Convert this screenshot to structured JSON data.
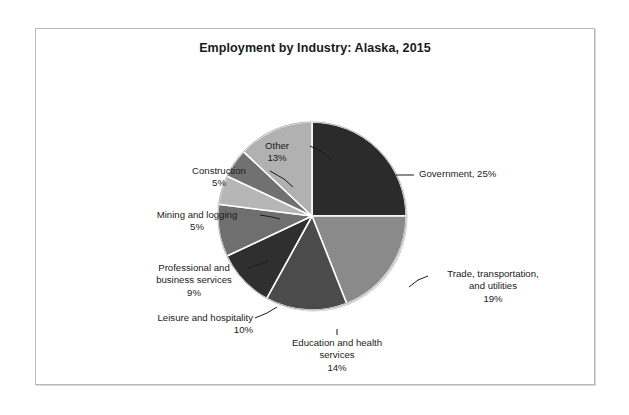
{
  "chart_data": {
    "type": "pie",
    "title": "Employment by Industry: Alaska, 2015",
    "xlabel": "",
    "ylabel": "",
    "legend_position": "none",
    "grid": false,
    "units": "percent of total employment",
    "categories": [
      "Government",
      "Trade, transportation, and utilities",
      "Education and health services",
      "Leisure and hospitality",
      "Professional and business services",
      "Mining and logging",
      "Construction",
      "Other"
    ],
    "values": [
      25,
      19,
      14,
      10,
      9,
      5,
      5,
      13
    ],
    "colors": [
      "#2b2b2b",
      "#8a8a8a",
      "#4b4b4b",
      "#2f2f2f",
      "#6f6f6f",
      "#b6b6b6",
      "#717171",
      "#b1b1b1"
    ],
    "start_angle_deg": 0,
    "direction": "clockwise",
    "slices": [
      {
        "name": "Government",
        "label": "Government, 25%",
        "value": 25,
        "value_text": "25%",
        "color": "#2b2b2b"
      },
      {
        "name": "Trade, transportation, and utilities",
        "label": "Trade, transportation,\nand utilities\n19%",
        "value": 19,
        "value_text": "19%",
        "color": "#8a8a8a"
      },
      {
        "name": "Education and health services",
        "label": "Education and health\nservices\n14%",
        "value": 14,
        "value_text": "14%",
        "color": "#4b4b4b"
      },
      {
        "name": "Leisure and hospitality",
        "label": "Leisure and hospitality\n10%",
        "value": 10,
        "value_text": "10%",
        "color": "#2f2f2f"
      },
      {
        "name": "Professional and business services",
        "label": "Professional and\nbusiness services\n9%",
        "value": 9,
        "value_text": "9%",
        "color": "#6f6f6f"
      },
      {
        "name": "Mining and logging",
        "label": "Mining and logging\n5%",
        "value": 5,
        "value_text": "5%",
        "color": "#b6b6b6"
      },
      {
        "name": "Construction",
        "label": "Construction\n5%",
        "value": 5,
        "value_text": "5%",
        "color": "#717171"
      },
      {
        "name": "Other",
        "label": "Other\n13%",
        "value": 13,
        "value_text": "13%",
        "color": "#b1b1b1"
      }
    ]
  },
  "chart": {
    "title": "Employment by Industry: Alaska, 2015",
    "labels": {
      "government": "Government, 25%",
      "trade": "Trade, transportation,\nand utilities\n19%",
      "education": "Education and health\nservices\n14%",
      "leisure": "Leisure and hospitality\n10%",
      "professional": "Professional and\nbusiness services\n9%",
      "mining": "Mining and logging\n5%",
      "construction": "Construction\n5%",
      "other": "Other\n13%"
    }
  },
  "style": {
    "frame_border": "#b9b9b9",
    "background": "#ffffff",
    "text": "#1b1b1b",
    "slice_separator": "#ffffff"
  }
}
